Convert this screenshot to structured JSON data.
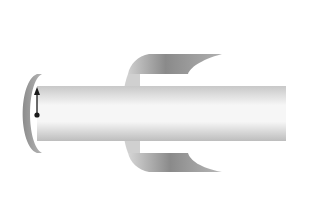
{
  "diagram": {
    "labels": {
      "coil": "C",
      "solenoid": "S",
      "radius": "R"
    },
    "solenoid": {
      "turns_per_row": 21,
      "top_row_symbol": "dot (current out of page)",
      "bottom_row_symbol": "cross (current into page)"
    },
    "coil": {
      "turns_per_row": 6
    },
    "colors": {
      "outline": "#1a1a1a",
      "box_fill": "#ffffff",
      "shade_dark": "#7a7a7a",
      "shade_light": "#f2f2f2"
    }
  }
}
